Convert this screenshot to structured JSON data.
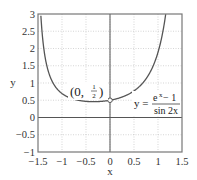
{
  "chart_data": {
    "type": "line",
    "title": "",
    "xlabel": "x",
    "ylabel": "y",
    "xlim": [
      -1.5,
      1.5
    ],
    "ylim": [
      -1,
      3
    ],
    "x_ticks": [
      -1.5,
      -1,
      -0.5,
      0,
      0.5,
      1,
      1.5
    ],
    "x_tick_labels": [
      "−1.5",
      "−1",
      "−0.5",
      "0",
      "0.5",
      "1",
      "1.5"
    ],
    "y_ticks": [
      -1,
      -0.5,
      0,
      0.5,
      1,
      1.5,
      2,
      2.5,
      3
    ],
    "y_tick_labels": [
      "−1",
      "−0.5",
      "0",
      "0.5",
      "1",
      "1.5",
      "2",
      "2.5",
      "3"
    ],
    "grid": true,
    "series": [
      {
        "name": "y = (e^x − 1) / sin 2x",
        "function": "(exp(x)-1)/sin(2x)",
        "x_range": [
          -1.5,
          1.5
        ],
        "hole_at": [
          0,
          0.5
        ],
        "sample_points": [
          {
            "x": -1.4,
            "y": 2.26
          },
          {
            "x": -1.2,
            "y": 1.04
          },
          {
            "x": -1.0,
            "y": 0.69
          },
          {
            "x": -0.8,
            "y": 0.55
          },
          {
            "x": -0.5,
            "y": 0.47
          },
          {
            "x": -0.25,
            "y": 0.46
          },
          {
            "x": 0,
            "y": 0.5
          },
          {
            "x": 0.25,
            "y": 0.59
          },
          {
            "x": 0.5,
            "y": 0.77
          },
          {
            "x": 0.75,
            "y": 1.12
          },
          {
            "x": 1.0,
            "y": 1.89
          },
          {
            "x": 1.1,
            "y": 2.47
          }
        ]
      }
    ],
    "annotations": [
      {
        "text": "(0, 1/2)",
        "x": 0,
        "y": 0.5
      },
      {
        "text": "y = (e^x − 1) / sin 2x",
        "position": "right"
      }
    ],
    "legend": "none"
  },
  "labels": {
    "x_axis": "x",
    "y_axis": "y",
    "point_label_prefix": "(0, ",
    "point_num": "1",
    "point_den": "2",
    "point_label_suffix": ")",
    "eq_lhs": "y =",
    "eq_num": "e",
    "eq_num_sup": "x",
    "eq_num_rest": " − 1",
    "eq_den": "sin 2x"
  },
  "colors": {
    "curve": "#555555",
    "grid": "#bbbbbb",
    "axis": "#555555",
    "frame": "#777777"
  }
}
